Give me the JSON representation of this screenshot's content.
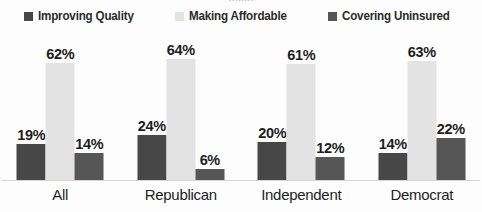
{
  "title_sliver": "........",
  "legend": {
    "items": [
      {
        "label": "Improving Quality",
        "color": "#474747"
      },
      {
        "label": "Making Affordable",
        "color": "#e3e3e3"
      },
      {
        "label": "Covering Uninsured",
        "color": "#565656"
      }
    ]
  },
  "axis": {
    "categories": [
      "All",
      "Republican",
      "Independent",
      "Democrat"
    ]
  },
  "labels": {
    "all": [
      "19%",
      "62%",
      "14%"
    ],
    "republican": [
      "24%",
      "64%",
      "6%"
    ],
    "independent": [
      "20%",
      "61%",
      "12%"
    ],
    "democrat": [
      "14%",
      "63%",
      "22%"
    ]
  },
  "chart_data": {
    "type": "bar",
    "title": "",
    "xlabel": "",
    "ylabel": "",
    "ylim": [
      0,
      70
    ],
    "grid": false,
    "legend_position": "top",
    "value_format": "percent",
    "categories": [
      "All",
      "Republican",
      "Independent",
      "Democrat"
    ],
    "series": [
      {
        "name": "Improving Quality",
        "color": "#474747",
        "values": [
          19,
          24,
          20,
          14
        ]
      },
      {
        "name": "Making Affordable",
        "color": "#e3e3e3",
        "values": [
          62,
          64,
          61,
          63
        ]
      },
      {
        "name": "Covering Uninsured",
        "color": "#565656",
        "values": [
          14,
          6,
          12,
          22
        ]
      }
    ]
  }
}
